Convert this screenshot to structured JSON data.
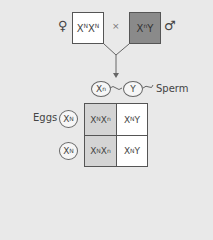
{
  "cross": {
    "female_symbol": "♀",
    "female_genotype": {
      "base1": "X",
      "sup1": "N",
      "base2": "X",
      "sup2": "N"
    },
    "cross_symbol": "×",
    "male_genotype": {
      "base1": "X",
      "sup1": "n",
      "base2": "Y"
    },
    "male_symbol": "♂"
  },
  "sperm": {
    "label": "Sperm",
    "gametes": [
      {
        "base": "X",
        "sup": "n"
      },
      {
        "base": "Y",
        "sup": ""
      }
    ]
  },
  "eggs": {
    "label": "Eggs",
    "gametes": [
      {
        "base": "X",
        "sup": "N"
      },
      {
        "base": "X",
        "sup": "N"
      }
    ]
  },
  "punnett": {
    "rows": [
      [
        {
          "b1": "X",
          "s1": "N",
          "b2": "X",
          "s2": "n",
          "shaded": true
        },
        {
          "b1": "X",
          "s1": "N",
          "b2": "Y",
          "s2": "",
          "shaded": false
        }
      ],
      [
        {
          "b1": "X",
          "s1": "N",
          "b2": "X",
          "s2": "n",
          "shaded": true
        },
        {
          "b1": "X",
          "s1": "N",
          "b2": "Y",
          "s2": "",
          "shaded": false
        }
      ]
    ]
  },
  "colors": {
    "background": "#e9e9e9",
    "female_box": "#ffffff",
    "male_box": "#8a8a8a",
    "carrier_cell": "#d4d4d4",
    "normal_cell": "#ffffff"
  }
}
